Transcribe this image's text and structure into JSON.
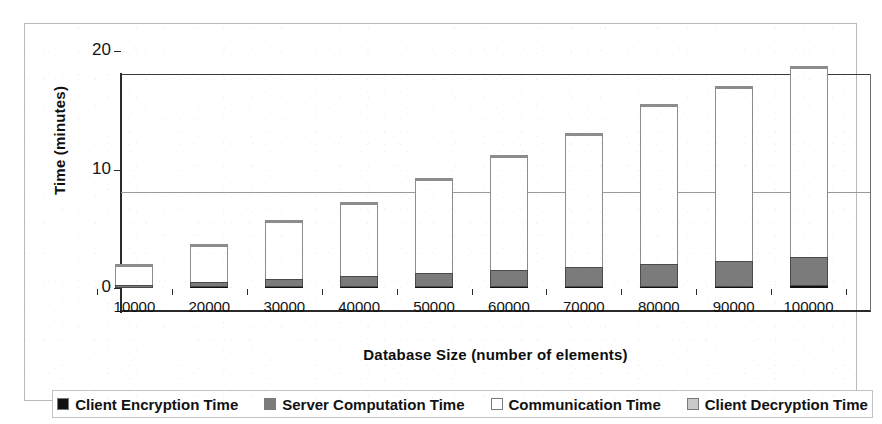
{
  "figure": {
    "background_color": "#ffffff",
    "frame_color": "#b9b9b9"
  },
  "chart_data": {
    "type": "bar",
    "stacked": true,
    "title": "",
    "xlabel": "Database Size (number of elements)",
    "ylabel": "Time (minutes)",
    "categories": [
      "10000",
      "20000",
      "30000",
      "40000",
      "50000",
      "60000",
      "70000",
      "80000",
      "90000",
      "100000"
    ],
    "ylim": [
      0,
      20
    ],
    "yticks": [
      "0",
      "10",
      "20"
    ],
    "ytick_values": [
      0,
      10,
      20
    ],
    "grid": "horizontal",
    "legend_position": "bottom",
    "series": [
      {
        "name": "Client Encryption Time",
        "color": "#111111",
        "values": [
          0.04,
          0.05,
          0.06,
          0.07,
          0.08,
          0.09,
          0.1,
          0.11,
          0.12,
          0.13
        ]
      },
      {
        "name": "Server Computation Time",
        "color": "#7b7b7b",
        "values": [
          0.2,
          0.45,
          0.7,
          0.95,
          1.2,
          1.45,
          1.7,
          1.9,
          2.15,
          2.45
        ]
      },
      {
        "name": "Communication Time",
        "color": "#ffffff",
        "values": [
          1.62,
          3.05,
          4.79,
          6.03,
          7.87,
          9.51,
          11.15,
          13.34,
          14.58,
          15.97
        ]
      },
      {
        "name": "Client Decryption Time",
        "color": "#c9c9c9",
        "values": [
          0.04,
          0.05,
          0.05,
          0.05,
          0.05,
          0.05,
          0.05,
          0.05,
          0.05,
          0.05
        ]
      }
    ],
    "totals": [
      1.9,
      3.6,
      5.6,
      7.1,
      9.2,
      11.1,
      13.0,
      15.4,
      16.9,
      18.6
    ]
  },
  "legend": {
    "items": [
      {
        "label": "Client Encryption Time",
        "swatch": "#111111"
      },
      {
        "label": "Server Computation Time",
        "swatch": "#7b7b7b"
      },
      {
        "label": "Communication Time",
        "swatch": "#ffffff"
      },
      {
        "label": "Client Decryption Time",
        "swatch": "#c9c9c9"
      }
    ]
  }
}
